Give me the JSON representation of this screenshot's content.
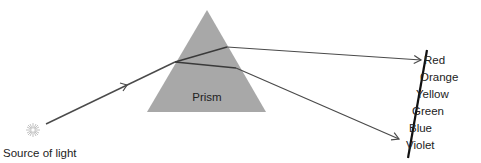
{
  "diagram": {
    "colors": {
      "prism_fill": "#a8a8a8",
      "ray": "#4a4a4a",
      "screen": "#111111",
      "text": "#222222",
      "source": "#bbbbbb"
    },
    "source": {
      "label": "Source of light",
      "icon": "light-burst-icon",
      "x": 33,
      "y": 130
    },
    "prism": {
      "label": "Prism",
      "apex": [
        207,
        10
      ],
      "base_left": [
        147,
        112
      ],
      "base_right": [
        266,
        112
      ]
    },
    "rays": {
      "incident": {
        "from": [
          46,
          124
        ],
        "to": [
          175,
          62
        ],
        "arrow_at": [
          125,
          86
        ]
      },
      "inside_red": {
        "from": [
          175,
          62
        ],
        "to": [
          227,
          47
        ]
      },
      "inside_violet": {
        "from": [
          175,
          62
        ],
        "to": [
          236,
          68
        ]
      },
      "exit_red": {
        "from": [
          227,
          47
        ],
        "to": [
          421,
          60
        ]
      },
      "exit_violet": {
        "from": [
          236,
          68
        ],
        "to": [
          399,
          139
        ]
      }
    },
    "screen": {
      "top": [
        427,
        50
      ],
      "bottom": [
        408,
        158
      ]
    },
    "spectrum": [
      {
        "label": "Red",
        "x": 424,
        "y": 64
      },
      {
        "label": "Orange",
        "x": 420,
        "y": 81
      },
      {
        "label": "Yellow",
        "x": 416,
        "y": 98
      },
      {
        "label": "Green",
        "x": 412,
        "y": 115
      },
      {
        "label": "Blue",
        "x": 409,
        "y": 132
      },
      {
        "label": "Violet",
        "x": 406,
        "y": 149
      }
    ]
  }
}
